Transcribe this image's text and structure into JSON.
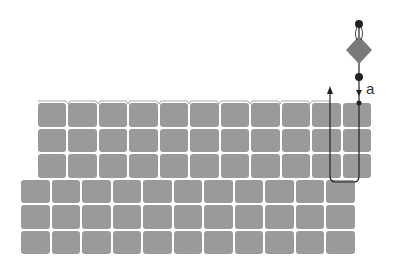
{
  "diagram": {
    "label_a": "a",
    "upper_block": {
      "cols": 11,
      "rows": 3,
      "x": 38,
      "y": 103,
      "w": 333,
      "h": 76
    },
    "lower_block": {
      "cols": 11,
      "rows": 3,
      "x": 21,
      "y": 179,
      "w": 334,
      "h": 75
    },
    "colors": {
      "tile": "#9a9a9a",
      "diamond": "#7a7a7a",
      "line": "#222222"
    }
  }
}
